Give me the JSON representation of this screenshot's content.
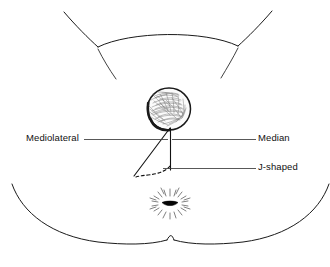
{
  "figure": {
    "kind": "anatomical-line-diagram",
    "background_color": "#ffffff",
    "ink_color": "#111111"
  },
  "labels": {
    "mediolateral": "Mediolateral",
    "median": "Median",
    "j_shaped": "J-shaped"
  },
  "structures": {
    "fetal_head": "fetal-head-crowning",
    "anus": "anus",
    "perineum": "perineum",
    "buttocks": "buttocks",
    "thighs": "thighs"
  },
  "incisions": {
    "mediolateral_style": "solid-diagonal",
    "median_style": "solid-vertical",
    "j_shaped_style": "dashed-curve"
  },
  "colors": {
    "outline": "#1a1a1a",
    "leader": "#3a3a3a",
    "hair_shading": "#6f6f6f",
    "anus_fill": "#050505"
  }
}
